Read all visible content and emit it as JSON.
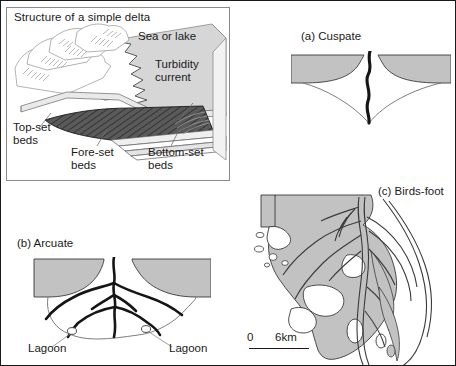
{
  "figure": {
    "background_color": "#ffffff",
    "border_color": "#1a1a1a",
    "land_fill": "#c2c2c2",
    "foreset_fill": "#555555",
    "line_color": "#1a1a1a",
    "thin_line_color": "#6f6f6f"
  },
  "delta_structure": {
    "title": "Structure of a simple delta",
    "labels": {
      "sea_or_lake": "Sea or lake",
      "turbidity_current": "Turbidity\ncurrent",
      "top_set": "Top-set\nbeds",
      "fore_set": "Fore-set\nbeds",
      "bottom_set": "Bottom-set\nbeds"
    }
  },
  "cuspate": {
    "label": "(a) Cuspate"
  },
  "arcuate": {
    "label": "(b) Arcuate",
    "lagoon_left": "Lagoon",
    "lagoon_right": "Lagoon"
  },
  "birdsfoot": {
    "label": "(c) Birds-foot",
    "scale": {
      "zero": "0",
      "distance": "6km"
    }
  }
}
